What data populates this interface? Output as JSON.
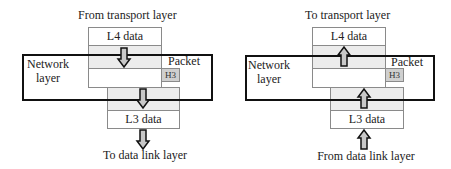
{
  "diagrams": [
    {
      "direction": "down",
      "top_caption": "From transport layer",
      "bottom_caption": "To data link layer",
      "upper_data_label": "L4 data",
      "lower_data_label": "L3 data",
      "header_label": "H3",
      "layer_label_line1": "Network",
      "layer_label_line2": "layer",
      "packet_label": "Packet"
    },
    {
      "direction": "up",
      "top_caption": "To transport layer",
      "bottom_caption": "From data link layer",
      "upper_data_label": "L4 data",
      "lower_data_label": "L3 data",
      "header_label": "H3",
      "layer_label_line1": "Network",
      "layer_label_line2": "layer",
      "packet_label": "Packet"
    }
  ],
  "colors": {
    "arrow_fill": "#c8c8c8",
    "arrow_stroke": "#111111",
    "grey_cell": "#ececec",
    "header_cell": "#cfcfcf",
    "network_box_border": "#111111"
  }
}
